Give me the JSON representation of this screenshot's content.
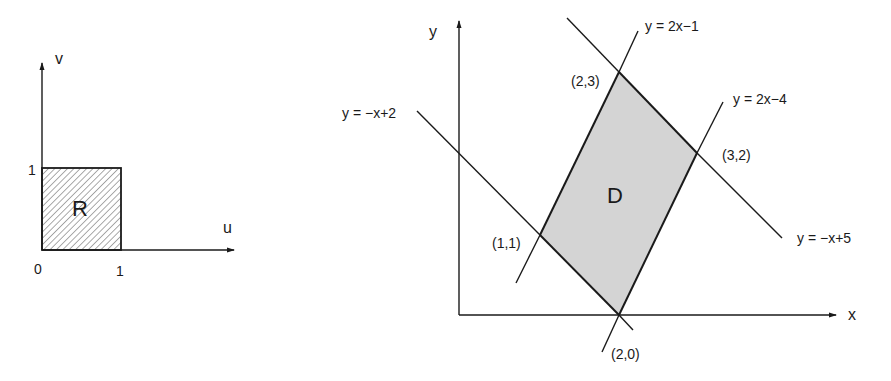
{
  "left_diagram": {
    "title": "Region R in uv-plane",
    "axis_u_label": "u",
    "axis_v_label": "v",
    "origin_label": "0",
    "u_tick_label": "1",
    "v_tick_label": "1",
    "region_label": "R",
    "region_fill": "hatched",
    "region_corners": [
      [
        0,
        0
      ],
      [
        1,
        0
      ],
      [
        1,
        1
      ],
      [
        0,
        1
      ]
    ]
  },
  "right_diagram": {
    "title": "Region D in xy-plane",
    "axis_x_label": "x",
    "axis_y_label": "y",
    "region_label": "D",
    "region_fill_color": "#d4d4d4",
    "lines": [
      {
        "equation": "y = 2x−1"
      },
      {
        "equation": "y = 2x−4"
      },
      {
        "equation": "y = −x+2"
      },
      {
        "equation": "y = −x+5"
      }
    ],
    "vertices": [
      {
        "label": "(2,3)",
        "x": 2,
        "y": 3
      },
      {
        "label": "(3,2)",
        "x": 3,
        "y": 2
      },
      {
        "label": "(1,1)",
        "x": 1,
        "y": 1
      },
      {
        "label": "(2,0)",
        "x": 2,
        "y": 0
      }
    ]
  }
}
